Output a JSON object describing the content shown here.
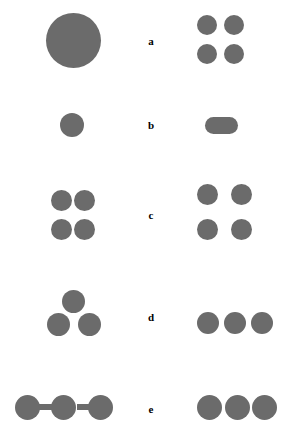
{
  "figure": {
    "width": 294,
    "height": 432,
    "background_color": "#ffffff",
    "shape_color": "#6b6b6b",
    "label_color": "#000000",
    "rows": [
      {
        "label": "a",
        "label_x": 141,
        "label_y": 36,
        "left_shapes": [
          {
            "name": "large-circle",
            "type": "circle",
            "x": 46,
            "y": 13,
            "w": 55,
            "h": 55
          }
        ],
        "right_shapes": [
          {
            "name": "circle-top-left",
            "type": "circle",
            "x": 197,
            "y": 15,
            "w": 20,
            "h": 20
          },
          {
            "name": "circle-top-right",
            "type": "circle",
            "x": 224,
            "y": 15,
            "w": 20,
            "h": 20
          },
          {
            "name": "circle-bottom-left",
            "type": "circle",
            "x": 197,
            "y": 44,
            "w": 20,
            "h": 20
          },
          {
            "name": "circle-bottom-right",
            "type": "circle",
            "x": 224,
            "y": 44,
            "w": 20,
            "h": 20
          }
        ]
      },
      {
        "label": "b",
        "label_x": 141,
        "label_y": 120,
        "left_shapes": [
          {
            "name": "single-circle",
            "type": "circle",
            "x": 60,
            "y": 113,
            "w": 24,
            "h": 24
          }
        ],
        "right_shapes": [
          {
            "name": "horizontal-capsule",
            "type": "capsule",
            "x": 205,
            "y": 117,
            "w": 33,
            "h": 17
          }
        ]
      },
      {
        "label": "c",
        "label_x": 141,
        "label_y": 210,
        "left_shapes": [
          {
            "name": "circle-top-left",
            "type": "circle",
            "x": 51,
            "y": 190,
            "w": 21,
            "h": 21
          },
          {
            "name": "circle-top-right",
            "type": "circle",
            "x": 74,
            "y": 190,
            "w": 21,
            "h": 21
          },
          {
            "name": "circle-bottom-left",
            "type": "circle",
            "x": 51,
            "y": 219,
            "w": 21,
            "h": 21
          },
          {
            "name": "circle-bottom-right",
            "type": "circle",
            "x": 74,
            "y": 219,
            "w": 21,
            "h": 21
          }
        ],
        "right_shapes": [
          {
            "name": "circle-top-left",
            "type": "circle",
            "x": 197,
            "y": 184,
            "w": 21,
            "h": 21
          },
          {
            "name": "circle-top-right",
            "type": "circle",
            "x": 231,
            "y": 184,
            "w": 21,
            "h": 21
          },
          {
            "name": "circle-bottom-left",
            "type": "circle",
            "x": 197,
            "y": 219,
            "w": 21,
            "h": 21
          },
          {
            "name": "circle-bottom-right",
            "type": "circle",
            "x": 231,
            "y": 219,
            "w": 21,
            "h": 21
          }
        ]
      },
      {
        "label": "d",
        "label_x": 141,
        "label_y": 312,
        "left_shapes": [
          {
            "name": "circle-apex",
            "type": "circle",
            "x": 62,
            "y": 290,
            "w": 23,
            "h": 23
          },
          {
            "name": "circle-base-left",
            "type": "circle",
            "x": 47,
            "y": 313,
            "w": 23,
            "h": 23
          },
          {
            "name": "circle-base-right",
            "type": "circle",
            "x": 78,
            "y": 313,
            "w": 23,
            "h": 23
          }
        ],
        "right_shapes": [
          {
            "name": "circle-left",
            "type": "circle",
            "x": 197,
            "y": 312,
            "w": 22,
            "h": 22
          },
          {
            "name": "circle-middle",
            "type": "circle",
            "x": 224,
            "y": 312,
            "w": 22,
            "h": 22
          },
          {
            "name": "circle-right",
            "type": "circle",
            "x": 251,
            "y": 312,
            "w": 22,
            "h": 22
          }
        ]
      },
      {
        "label": "e",
        "label_x": 141,
        "label_y": 404,
        "left_shapes": [
          {
            "name": "connector-bar-left",
            "type": "bar",
            "x": 38,
            "y": 404,
            "w": 14,
            "h": 6
          },
          {
            "name": "connector-bar-right",
            "type": "bar",
            "x": 77,
            "y": 404,
            "w": 14,
            "h": 6
          },
          {
            "name": "circle-left",
            "type": "circle",
            "x": 15,
            "y": 395,
            "w": 25,
            "h": 25
          },
          {
            "name": "circle-middle",
            "type": "circle",
            "x": 51,
            "y": 395,
            "w": 25,
            "h": 25
          },
          {
            "name": "circle-right",
            "type": "circle",
            "x": 88,
            "y": 395,
            "w": 25,
            "h": 25
          }
        ],
        "right_shapes": [
          {
            "name": "circle-left",
            "type": "circle",
            "x": 197,
            "y": 395,
            "w": 25,
            "h": 25
          },
          {
            "name": "circle-middle",
            "type": "circle",
            "x": 225,
            "y": 395,
            "w": 25,
            "h": 25
          },
          {
            "name": "circle-right",
            "type": "circle",
            "x": 252,
            "y": 395,
            "w": 25,
            "h": 25
          }
        ]
      }
    ]
  }
}
